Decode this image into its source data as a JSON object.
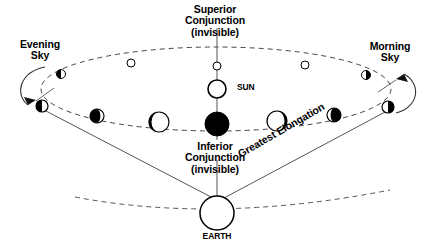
{
  "diagram": {
    "colors": {
      "stroke": "#1a1a1a",
      "fill_dark": "#000000",
      "fill_light": "#ffffff",
      "background": "#ffffff"
    },
    "labels": {
      "superior_conjunction": "Superior\nConjunction\n(invisible)",
      "inferior_conjunction": "Inferior\nConjunction\n(invisible)",
      "evening_sky": "Evening\nSky",
      "morning_sky": "Morning\nSky",
      "greatest_elongation": "Greatest Elongation",
      "sun": "SUN",
      "earth": "EARTH"
    },
    "bodies": {
      "sun": {
        "name": "SUN",
        "cx": 217,
        "cy": 89,
        "r": 9,
        "fill": "open"
      },
      "earth": {
        "name": "EARTH",
        "cx": 217,
        "cy": 213,
        "r": 17,
        "fill": "open"
      }
    },
    "orbit": {
      "cx": 216,
      "cy": 89,
      "rx": 175,
      "ry": 42,
      "style": "dashed",
      "note": "elliptical orbit of inner planet seen nearly edge-on"
    },
    "horizon_arc": {
      "style": "dashed",
      "note": "dashed arc through Earth"
    },
    "sight_lines": [
      {
        "from": "earth",
        "to": "evening-elongation-point"
      },
      {
        "from": "earth",
        "to": "morning-elongation-point"
      },
      {
        "from": "earth",
        "to": "sun",
        "through": "inferior-conjunction"
      }
    ],
    "conjunction_line": {
      "note": "vertical line joining superior conjunction, Sun, inferior conjunction and Earth"
    },
    "far_orbit_positions": [
      {
        "id": "far-1",
        "cx": 61,
        "cy": 74,
        "r": 4.5,
        "phase": "half-dark-left"
      },
      {
        "id": "far-2",
        "cx": 131,
        "cy": 63,
        "r": 4,
        "phase": "open"
      },
      {
        "id": "far-3",
        "cx": 217,
        "cy": 66,
        "r": 4,
        "phase": "open",
        "role": "superior-conjunction"
      },
      {
        "id": "far-4",
        "cx": 305,
        "cy": 65,
        "r": 4,
        "phase": "open"
      },
      {
        "id": "far-5",
        "cx": 366,
        "cy": 75,
        "r": 4.5,
        "phase": "half-dark-right"
      }
    ],
    "near_orbit_positions": [
      {
        "id": "near-1",
        "cx": 42,
        "cy": 106,
        "r": 6,
        "phase": "half-dark-left",
        "role": "greatest-eastern-elongation"
      },
      {
        "id": "near-2",
        "cx": 97,
        "cy": 116,
        "r": 7,
        "phase": "gibbous-dark-left"
      },
      {
        "id": "near-3",
        "cx": 159,
        "cy": 122,
        "r": 10,
        "phase": "crescent-dark-left"
      },
      {
        "id": "near-4",
        "cx": 217,
        "cy": 124,
        "r": 12,
        "phase": "full-dark",
        "role": "inferior-conjunction"
      },
      {
        "id": "near-5",
        "cx": 277,
        "cy": 121,
        "r": 10,
        "phase": "crescent-dark-right"
      },
      {
        "id": "near-6",
        "cx": 334,
        "cy": 115,
        "r": 7,
        "phase": "gibbous-dark-right"
      },
      {
        "id": "near-7",
        "cx": 388,
        "cy": 107,
        "r": 6,
        "phase": "half-dark-right",
        "role": "greatest-western-elongation"
      }
    ],
    "arrows": [
      {
        "id": "evening-sky-arrow",
        "direction": "down-left",
        "near": "evening-elongation-point"
      },
      {
        "id": "morning-sky-arrow",
        "direction": "up-right",
        "near": "morning-elongation-point"
      }
    ]
  }
}
